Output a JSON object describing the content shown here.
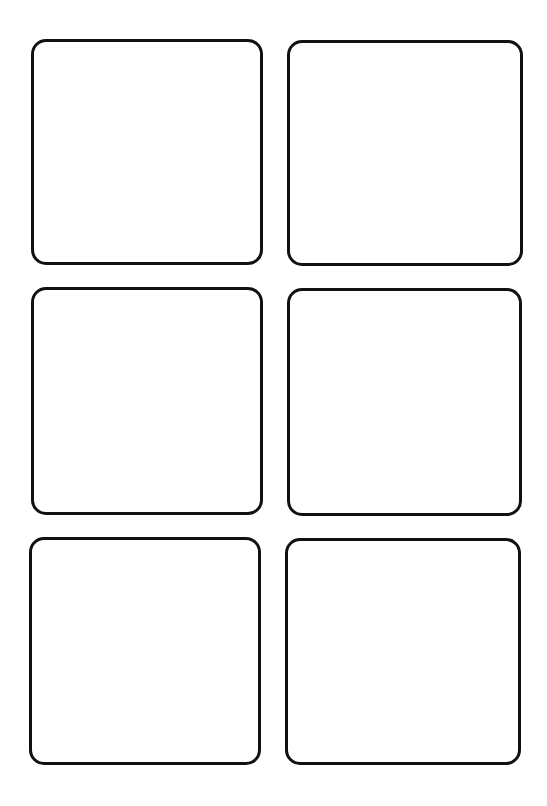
{
  "page": {
    "background": "#ffffff",
    "border_color": "#111111"
  },
  "cards": [
    {
      "row": 1,
      "col": 1,
      "left": 31,
      "top": 39,
      "width": 232,
      "height": 226
    },
    {
      "row": 1,
      "col": 2,
      "left": 287,
      "top": 40,
      "width": 236,
      "height": 226
    },
    {
      "row": 2,
      "col": 1,
      "left": 31,
      "top": 287,
      "width": 232,
      "height": 228
    },
    {
      "row": 2,
      "col": 2,
      "left": 287,
      "top": 288,
      "width": 235,
      "height": 228
    },
    {
      "row": 3,
      "col": 1,
      "left": 29,
      "top": 537,
      "width": 232,
      "height": 228
    },
    {
      "row": 3,
      "col": 2,
      "left": 285,
      "top": 538,
      "width": 236,
      "height": 227
    }
  ]
}
